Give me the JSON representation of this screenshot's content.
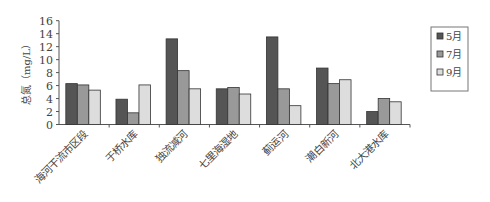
{
  "chart_data": {
    "type": "bar",
    "title": "",
    "xlabel": "",
    "ylabel": "总氮（mg/L）",
    "ylim": [
      0,
      16
    ],
    "yticks": [
      0,
      2,
      4,
      6,
      8,
      10,
      12,
      14,
      16
    ],
    "grid": false,
    "legend_position": "right",
    "categories": [
      "海河干流市区段",
      "于桥水库",
      "独流减河",
      "七里海湿地",
      "蓟运河",
      "潮白新河",
      "北大港水库"
    ],
    "series": [
      {
        "name": "5月",
        "color": "#555555",
        "values": [
          6.3,
          3.9,
          13.2,
          5.5,
          13.5,
          8.7,
          2.0
        ]
      },
      {
        "name": "7月",
        "color": "#999999",
        "values": [
          6.1,
          1.8,
          8.3,
          5.7,
          5.5,
          6.3,
          4.0
        ]
      },
      {
        "name": "9月",
        "color": "#dddddd",
        "values": [
          5.3,
          6.1,
          5.5,
          4.7,
          2.9,
          6.9,
          3.5
        ]
      }
    ]
  }
}
